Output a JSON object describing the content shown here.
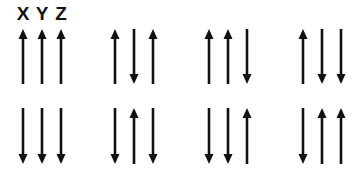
{
  "labels": {
    "x": "X",
    "y": "Y",
    "z": "Z"
  },
  "colors": {
    "arrow": "#111111",
    "background": "#ffffff"
  },
  "groups": [
    {
      "columns_x": [
        23,
        42,
        61
      ],
      "row1": [
        "up",
        "up",
        "up"
      ],
      "row2": [
        "down",
        "down",
        "down"
      ]
    },
    {
      "columns_x": [
        115,
        134,
        153
      ],
      "row1": [
        "up",
        "down",
        "up"
      ],
      "row2": [
        "down",
        "up",
        "down"
      ]
    },
    {
      "columns_x": [
        209,
        228,
        247
      ],
      "row1": [
        "up",
        "up",
        "down"
      ],
      "row2": [
        "down",
        "down",
        "up"
      ]
    },
    {
      "columns_x": [
        303,
        322,
        341
      ],
      "row1": [
        "up",
        "down",
        "down"
      ],
      "row2": [
        "down",
        "up",
        "up"
      ]
    }
  ],
  "rows": {
    "row1": {
      "top": 29,
      "bottom": 84
    },
    "row2": {
      "top": 108,
      "bottom": 164
    }
  }
}
